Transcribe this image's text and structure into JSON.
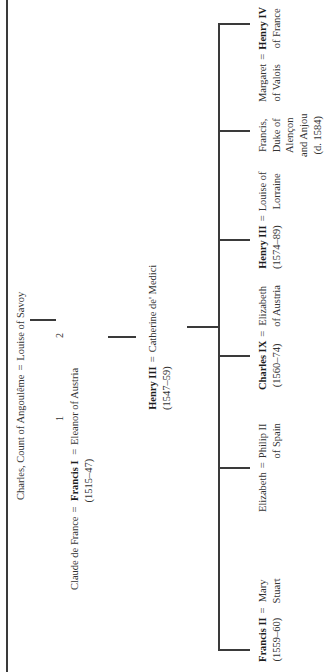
{
  "diagram": {
    "orientation": "rotated-90-ccw",
    "line_color": "#3a3a3a",
    "text_color": "#333333",
    "generation_1": {
      "husband": "Charles, Count of Angoulême",
      "equals": "=",
      "wife": "Louise of Savoy"
    },
    "generation_2": {
      "wife_1": "Claude de France",
      "wife_1_marker": "1",
      "equals_1": "=",
      "king": "Francis I",
      "king_reign": "(1515–47)",
      "equals_2": "=",
      "wife_2_marker": "2",
      "wife_2": "Eleanor of Austria"
    },
    "generation_3": {
      "king": "Henry III",
      "king_reign": "(1547–59)",
      "equals": "=",
      "wife": "Catherine de' Medici"
    },
    "children": [
      {
        "name": "Francis II",
        "bold": true,
        "reign": "(1559–60)",
        "equals": "=",
        "spouse_lines": [
          "Mary",
          "Stuart"
        ]
      },
      {
        "name": "Elizabeth",
        "bold": false,
        "reign": "",
        "equals": "=",
        "spouse_lines": [
          "Philip II",
          "of Spain"
        ]
      },
      {
        "name": "Charles IX",
        "bold": true,
        "reign": "(1560–74)",
        "equals": "=",
        "spouse_lines": [
          "Elizabeth",
          "of Austria"
        ]
      },
      {
        "name": "Henry III",
        "bold": true,
        "reign": "(1574–89)",
        "equals": "=",
        "spouse_lines": [
          "Louise of",
          "Lorraine"
        ]
      },
      {
        "name_lines": [
          "Francis,",
          "Duke of",
          "Alençon",
          "and Anjou",
          "(d. 1584)"
        ],
        "bold": false
      },
      {
        "name_lines": [
          "Margaret",
          "of Valois"
        ],
        "bold": false,
        "equals": "=",
        "spouse": "Henry IV",
        "spouse_bold": true,
        "spouse_sub": "of France"
      }
    ]
  }
}
